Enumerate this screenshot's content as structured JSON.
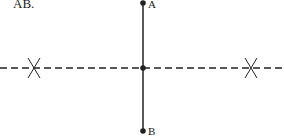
{
  "caption_fragment": "AB.",
  "points": {
    "A": {
      "label": "A",
      "x": 143,
      "y": 3
    },
    "M": {
      "label": "",
      "x": 143,
      "y": 68
    },
    "B": {
      "label": "B",
      "x": 143,
      "y": 131
    }
  },
  "segment": {
    "from": "A",
    "to": "B",
    "style": "solid"
  },
  "bisector": {
    "y": 68,
    "x1": 0,
    "x2": 284,
    "style": "dashed"
  },
  "arc_marks": [
    {
      "x": 34,
      "y": 68
    },
    {
      "x": 251,
      "y": 68
    }
  ],
  "colors": {
    "line": "#222222",
    "background": "#ffffff"
  }
}
